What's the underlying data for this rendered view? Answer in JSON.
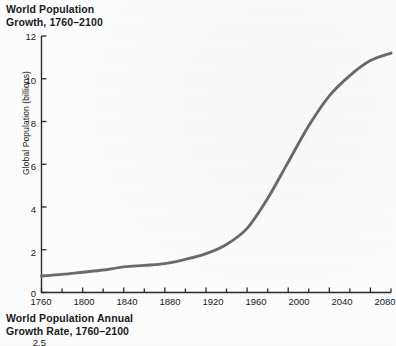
{
  "figure1": {
    "title": "World Population\nGrowth, 1760–2100",
    "ylabel": "Global Population (billions)"
  },
  "figure2": {
    "title": "World Population Annual\nGrowth Rate, 1760–2100",
    "first_ytick": "2.5"
  },
  "colors": {
    "line": "#6b6b6b",
    "axis": "#2b2b2b",
    "background": "#fdfdfd",
    "text": "#1a1a1a"
  },
  "chart_data": {
    "type": "line",
    "title": "World Population Growth, 1760–2100",
    "xlabel": "",
    "ylabel": "Global Population (billions)",
    "xlim": [
      1760,
      2100
    ],
    "ylim": [
      0,
      12
    ],
    "grid": false,
    "legend": "none",
    "x_major_ticks": [
      1760,
      1800,
      1840,
      1880,
      1920,
      1960,
      2000,
      2040,
      2080
    ],
    "x_minor_tick_interval": 20,
    "y_major_ticks": [
      0,
      2,
      4,
      6,
      8,
      10,
      12
    ],
    "series": [
      {
        "name": "Global population",
        "x": [
          1760,
          1780,
          1800,
          1820,
          1840,
          1860,
          1880,
          1900,
          1920,
          1940,
          1960,
          1980,
          2000,
          2020,
          2040,
          2060,
          2080,
          2100
        ],
        "values": [
          0.77,
          0.85,
          0.95,
          1.05,
          1.2,
          1.27,
          1.35,
          1.55,
          1.82,
          2.25,
          3.0,
          4.4,
          6.1,
          7.8,
          9.2,
          10.15,
          10.85,
          11.2
        ]
      }
    ]
  }
}
